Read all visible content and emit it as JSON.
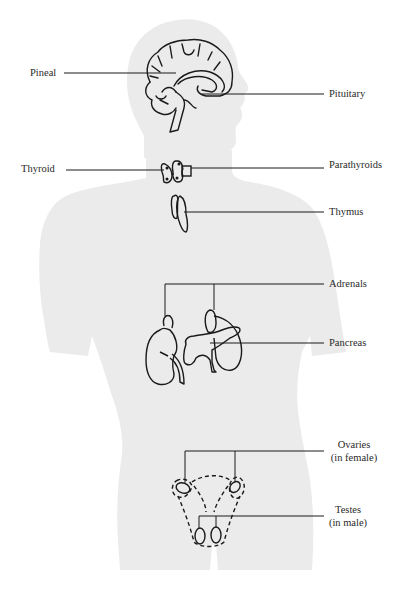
{
  "diagram": {
    "type": "anatomical illustration",
    "colors": {
      "background": "#ffffff",
      "silhouette": "#ebebeb",
      "ink": "#1a1a1a",
      "text": "#2a2a2a"
    },
    "labels": {
      "pineal": "Pineal",
      "pituitary": "Pituitary",
      "thyroid": "Thyroid",
      "parathyroids": "Parathyroids",
      "thymus": "Thymus",
      "adrenals": "Adrenals",
      "pancreas": "Pancreas",
      "ovaries_line1": "Ovaries",
      "ovaries_line2": "(in female)",
      "testes_line1": "Testes",
      "testes_line2": "(in male)"
    }
  }
}
